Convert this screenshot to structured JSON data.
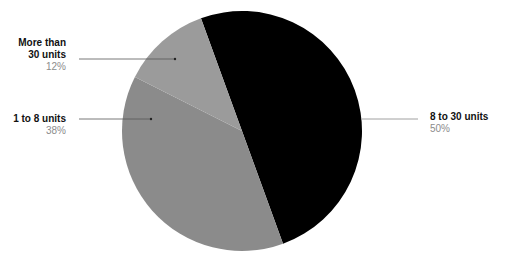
{
  "chart_data": {
    "type": "pie",
    "title": "",
    "center": [
      242,
      131
    ],
    "radius": 120,
    "start_angle_deg": 340,
    "slices": [
      {
        "label": "8 to 30 units",
        "value": 50,
        "pct_label": "50%",
        "color": "#000000"
      },
      {
        "label": "1 to 8 units",
        "value": 38,
        "pct_label": "38%",
        "color": "#8b8b8b"
      },
      {
        "label": "More than 30 units",
        "value": 12,
        "pct_label": "12%",
        "color": "#9b9b9b"
      }
    ],
    "legend_position": "callouts"
  },
  "labels": {
    "s0": {
      "name": "8 to 30 units",
      "pct": "50%"
    },
    "s1": {
      "name": "1 to 8 units",
      "pct": "38%"
    },
    "s2": {
      "name_line1": "More than",
      "name_line2": "30 units",
      "pct": "12%"
    }
  },
  "leader_color": "#444444"
}
